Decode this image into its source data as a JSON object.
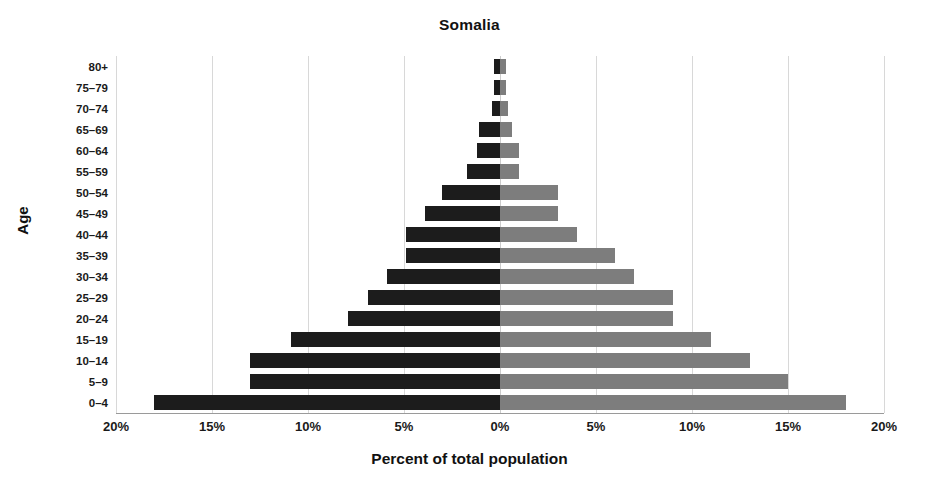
{
  "chart_data": {
    "type": "bar",
    "subtype": "population-pyramid",
    "title": "Somalia",
    "xlabel": "Percent of total population",
    "ylabel": "Age",
    "grid": true,
    "legend": "none",
    "orientation": "horizontal",
    "xlim": [
      -20,
      20
    ],
    "xticks": [
      -20,
      -15,
      -10,
      -5,
      0,
      5,
      10,
      15,
      20
    ],
    "xtick_labels": [
      "20%",
      "15%",
      "10%",
      "5%",
      "0%",
      "5%",
      "10%",
      "15%",
      "20%"
    ],
    "categories": [
      "80+",
      "75–79",
      "70–74",
      "65–69",
      "60–64",
      "55–59",
      "50–54",
      "45–49",
      "40–44",
      "35–39",
      "30–34",
      "25–29",
      "20–24",
      "15–19",
      "10–14",
      "5–9",
      "0–4"
    ],
    "series": [
      {
        "name": "Male",
        "side": "left",
        "color": "#1c1c1c",
        "values": [
          0.3,
          0.3,
          0.4,
          1.1,
          1.2,
          1.7,
          3.0,
          3.9,
          4.9,
          4.9,
          5.9,
          6.9,
          7.9,
          10.9,
          13.0,
          13.0,
          18.0
        ]
      },
      {
        "name": "Female",
        "side": "right",
        "color": "#7d7d7d",
        "values": [
          0.3,
          0.3,
          0.4,
          0.6,
          1.0,
          1.0,
          3.0,
          3.0,
          4.0,
          6.0,
          7.0,
          9.0,
          9.0,
          11.0,
          13.0,
          15.0,
          18.0
        ]
      }
    ]
  },
  "colors": {
    "male_bar": "#1c1c1c",
    "female_bar": "#7d7d7d",
    "gridline": "#d8d8d8",
    "text": "#1a1a1a",
    "background": "#ffffff"
  }
}
